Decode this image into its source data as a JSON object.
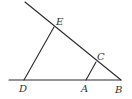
{
  "diagram": {
    "points": {
      "E": {
        "label": "E"
      },
      "C": {
        "label": "C"
      },
      "B": {
        "label": "B"
      },
      "A": {
        "label": "A"
      },
      "D": {
        "label": "D"
      }
    },
    "segments": [
      {
        "name": "ray-through-E-C-B",
        "from": "ext_top",
        "to": "B"
      },
      {
        "name": "ray-through-D-A-B",
        "from": "ext_left",
        "to": "B"
      },
      {
        "name": "segment-DE",
        "from": "D",
        "to": "E"
      },
      {
        "name": "segment-AC",
        "from": "A",
        "to": "C"
      }
    ],
    "line_color": "#2a2a2a",
    "label_color": "#333333"
  }
}
